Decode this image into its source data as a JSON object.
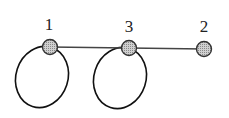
{
  "diagram": {
    "type": "graph",
    "nodes": [
      {
        "id": "1",
        "label": "1",
        "cx": 50,
        "cy": 47,
        "label_x": 49,
        "label_y": 30
      },
      {
        "id": "3",
        "label": "3",
        "cx": 129,
        "cy": 48,
        "label_x": 129,
        "label_y": 32
      },
      {
        "id": "2",
        "label": "2",
        "cx": 204,
        "cy": 49,
        "label_x": 204,
        "label_y": 32
      }
    ],
    "edges": [
      {
        "from": "1",
        "to": "3"
      },
      {
        "from": "3",
        "to": "2"
      }
    ],
    "self_loops": [
      {
        "node": "1"
      },
      {
        "node": "3"
      }
    ],
    "colors": {
      "node_fill": "#b0b0b0",
      "node_stroke": "#333333",
      "edge": "#444444",
      "loop": "#111111"
    }
  }
}
